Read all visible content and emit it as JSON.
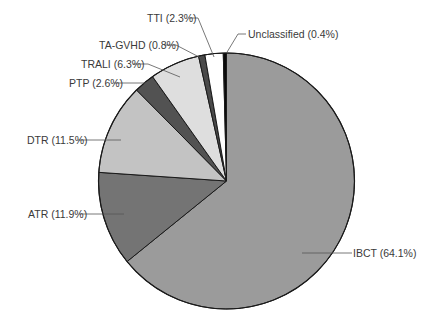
{
  "chart_data": {
    "type": "pie",
    "title": "",
    "start_angle_deg": 0,
    "direction": "clockwise",
    "categories": [
      "IBCT",
      "ATR",
      "DTR",
      "PTP",
      "TRALI",
      "TA-GVHD",
      "TTI",
      "Unclassified"
    ],
    "values": [
      64.1,
      11.9,
      11.5,
      2.6,
      6.3,
      0.8,
      2.3,
      0.4
    ],
    "unit": "%",
    "slices": [
      {
        "name": "IBCT",
        "value": 64.1,
        "label": "IBCT (64.1%)",
        "color": "#9b9b9b"
      },
      {
        "name": "ATR",
        "value": 11.9,
        "label": "ATR (11.9%)",
        "color": "#747474"
      },
      {
        "name": "DTR",
        "value": 11.5,
        "label": "DTR (11.5%)",
        "color": "#c3c3c3"
      },
      {
        "name": "PTP",
        "value": 2.6,
        "label": "PTP (2.6%)",
        "color": "#525252"
      },
      {
        "name": "TRALI",
        "value": 6.3,
        "label": "TRALI (6.3%)",
        "color": "#dedede"
      },
      {
        "name": "TA-GVHD",
        "value": 0.8,
        "label": "TA-GVHD (0.8%)",
        "color": "#4a4a4a"
      },
      {
        "name": "TTI",
        "value": 2.3,
        "label": "TTI (2.3%)",
        "color": "#ffffff"
      },
      {
        "name": "Unclassified",
        "value": 0.4,
        "label": "Unclassified (0.4%)",
        "color": "#0a0a0a"
      }
    ],
    "legend": "none (callout labels with leader lines)"
  },
  "labels": {
    "ibct": "IBCT (64.1%)",
    "atr": "ATR (11.9%)",
    "dtr": "DTR (11.5%)",
    "ptp": "PTP (2.6%)",
    "trali": "TRALI (6.3%)",
    "tagvhd": "TA-GVHD (0.8%)",
    "tti": "TTI (2.3%)",
    "unclassified": "Unclassified (0.4%)"
  }
}
